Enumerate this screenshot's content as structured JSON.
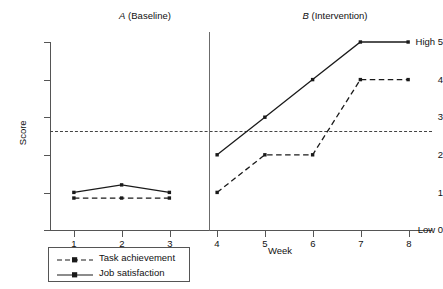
{
  "chart_data": {
    "type": "line",
    "title": "",
    "xlabel": "Week",
    "ylabel": "Score",
    "x": [
      1,
      2,
      3,
      4,
      5,
      6,
      7,
      8
    ],
    "xlim": [
      0.5,
      8.5
    ],
    "ylim": [
      0,
      5
    ],
    "grid": false,
    "legend_position": "bottom-left",
    "xtick_labels": [
      "1",
      "2",
      "3",
      "4",
      "5",
      "6",
      "7",
      "8"
    ],
    "ytick_labels": [
      "Low 0",
      "1",
      "2",
      "3",
      "4",
      "High 5"
    ],
    "ytick_values": [
      0,
      1,
      2,
      3,
      4,
      5
    ],
    "series": [
      {
        "name": "Task achievement",
        "line_style": "dashed",
        "marker": "square",
        "color": "#1a1a1a",
        "values": [
          0.85,
          0.85,
          0.85,
          1.0,
          2.0,
          2.0,
          4.0,
          4.0
        ],
        "phase_segments": [
          {
            "phase": "A",
            "x": [
              1,
              2,
              3
            ],
            "values": [
              0.85,
              0.85,
              0.85
            ]
          },
          {
            "phase": "B",
            "x": [
              4,
              5,
              6,
              7,
              8
            ],
            "values": [
              1.0,
              2.0,
              2.0,
              4.0,
              4.0
            ]
          }
        ]
      },
      {
        "name": "Job satisfaction",
        "line_style": "solid",
        "marker": "square",
        "color": "#1a1a1a",
        "values": [
          1.0,
          1.2,
          1.0,
          2.0,
          3.0,
          4.0,
          5.0,
          5.0
        ],
        "phase_segments": [
          {
            "phase": "A",
            "x": [
              1,
              2,
              3
            ],
            "values": [
              1.0,
              1.2,
              1.0
            ]
          },
          {
            "phase": "B",
            "x": [
              4,
              5,
              6,
              7,
              8
            ],
            "values": [
              2.0,
              3.0,
              4.0,
              5.0,
              5.0
            ]
          }
        ]
      }
    ],
    "annotations": {
      "phase_a_label": "A (Baseline)",
      "phase_a_letter": "A",
      "phase_a_rest": " (Baseline)",
      "phase_b_label": "B (Intervention)",
      "phase_b_letter": "B",
      "phase_b_rest": " (Intervention)",
      "phase_divider_x": 3.5,
      "reference_line_y": 2.5,
      "reference_line_style": "dashed"
    }
  },
  "axes": {
    "y_labels": {
      "t5": "High 5",
      "t4": "4",
      "t3": "3",
      "t2": "2",
      "t1": "1",
      "t0": "Low 0"
    },
    "x_labels": {
      "w1": "1",
      "w2": "2",
      "w3": "3",
      "w4": "4",
      "w5": "5",
      "w6": "6",
      "w7": "7",
      "w8": "8"
    },
    "y_title": "Score",
    "x_title": "Week"
  },
  "legend": {
    "entries": [
      {
        "label": "Task achievement",
        "style": "dashed"
      },
      {
        "label": "Job satisfaction",
        "style": "solid"
      }
    ]
  },
  "colors": {
    "line": "#1a1a1a",
    "axis": "#555555",
    "divider": "#6b6b6b",
    "reference": "#444444",
    "background": "#ffffff"
  }
}
